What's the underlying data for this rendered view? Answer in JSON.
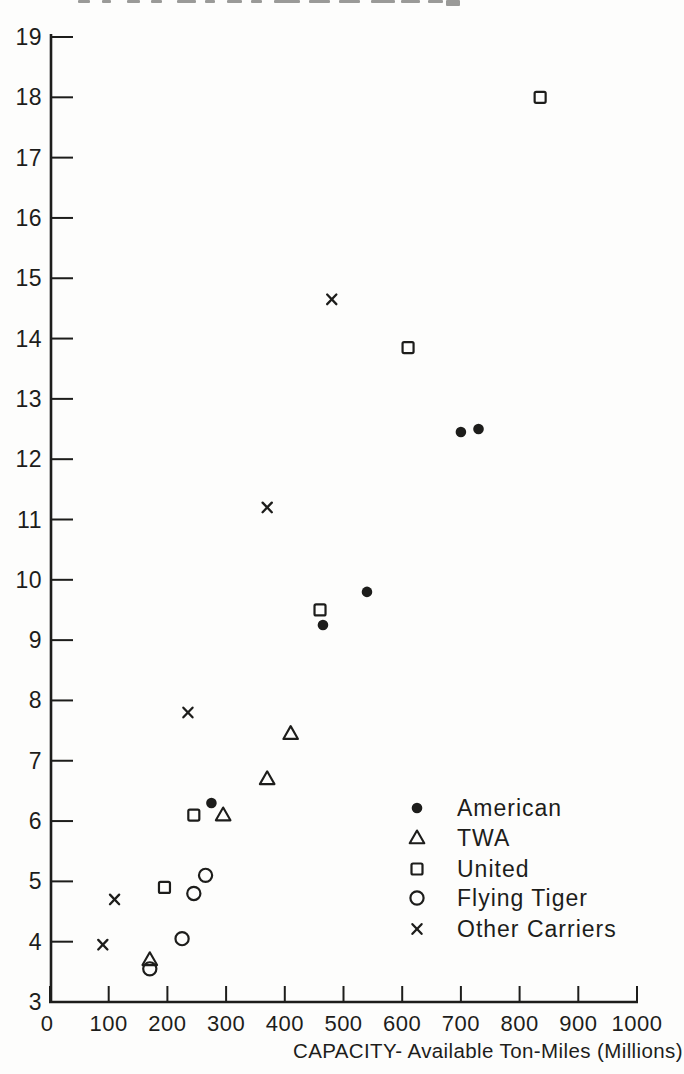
{
  "page": {
    "background": "#fdfdfc",
    "ink": "#1d1d1b"
  },
  "chart_data": {
    "type": "scatter",
    "title": "",
    "xlabel": "CAPACITY- Available Ton-Miles (Millions)",
    "ylabel": "",
    "xlim": [
      0,
      1000
    ],
    "ylim": [
      3,
      19
    ],
    "x_ticks": [
      0,
      100,
      200,
      300,
      400,
      500,
      600,
      700,
      800,
      900,
      1000
    ],
    "y_ticks": [
      3,
      4,
      5,
      6,
      7,
      8,
      9,
      10,
      11,
      12,
      13,
      14,
      15,
      16,
      17,
      18,
      19
    ],
    "grid": false,
    "legend_position": "inside-lower-right",
    "series": [
      {
        "name": "American",
        "marker": "filled-circle",
        "points": [
          [
            275,
            6.3
          ],
          [
            465,
            9.25
          ],
          [
            540,
            9.8
          ],
          [
            700,
            12.45
          ],
          [
            730,
            12.5
          ]
        ]
      },
      {
        "name": "TWA",
        "marker": "open-triangle",
        "points": [
          [
            170,
            3.7
          ],
          [
            295,
            6.1
          ],
          [
            370,
            6.7
          ],
          [
            410,
            7.45
          ]
        ]
      },
      {
        "name": "United",
        "marker": "open-square",
        "points": [
          [
            195,
            4.9
          ],
          [
            245,
            6.1
          ],
          [
            460,
            9.5
          ],
          [
            610,
            13.85
          ],
          [
            835,
            18.0
          ]
        ]
      },
      {
        "name": "Flying Tiger",
        "marker": "open-circle",
        "points": [
          [
            170,
            3.55
          ],
          [
            225,
            4.05
          ],
          [
            245,
            4.8
          ],
          [
            265,
            5.1
          ]
        ]
      },
      {
        "name": "Other Carriers",
        "marker": "x",
        "points": [
          [
            90,
            3.95
          ],
          [
            110,
            4.7
          ],
          [
            235,
            7.8
          ],
          [
            370,
            11.2
          ],
          [
            480,
            14.65
          ]
        ]
      }
    ]
  }
}
